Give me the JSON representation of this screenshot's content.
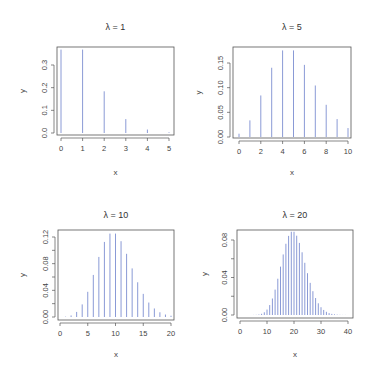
{
  "figure": {
    "width": 372,
    "height": 378,
    "bar_color": "#8a9ad6",
    "axis_color": "#555555",
    "text_color": "#444444"
  },
  "chart_data": [
    {
      "type": "bar",
      "subtype": "pmf-spikes",
      "title": "λ = 1",
      "xlabel": "x",
      "ylabel": "y",
      "x": [
        0,
        1,
        2,
        3,
        4,
        5
      ],
      "values": [
        0.3679,
        0.3679,
        0.1839,
        0.0613,
        0.0153,
        0.0031
      ],
      "xticks": [
        0,
        1,
        2,
        3,
        4,
        5
      ],
      "xtick_labels": [
        "0",
        "1",
        "2",
        "3",
        "4",
        "5"
      ],
      "yticks": [
        0,
        0.1,
        0.2,
        0.3
      ],
      "ytick_labels": [
        "0.0",
        "0.1",
        "0.2",
        "0.3"
      ],
      "xlim": [
        -0.2,
        5.2
      ],
      "ylim": [
        -0.005,
        0.37
      ],
      "grid": false,
      "layout": {
        "box": [
          57,
          47,
          174,
          135
        ],
        "x0": 61,
        "x1": 169,
        "xv0": 0,
        "xv1": 5,
        "y0px": 133,
        "y1px": 65,
        "yv0": 0,
        "yv1": 0.3,
        "title_y": 27,
        "xlabel_y": 172,
        "ylabel_x": 22
      }
    },
    {
      "type": "bar",
      "subtype": "pmf-spikes",
      "title": "λ = 5",
      "xlabel": "x",
      "ylabel": "y",
      "x": [
        0,
        1,
        2,
        3,
        4,
        5,
        6,
        7,
        8,
        9,
        10
      ],
      "values": [
        0.0067,
        0.0337,
        0.0842,
        0.1404,
        0.1755,
        0.1755,
        0.1462,
        0.1044,
        0.0653,
        0.0363,
        0.0181
      ],
      "xticks": [
        0,
        2,
        4,
        6,
        8,
        10
      ],
      "xtick_labels": [
        "0",
        "2",
        "4",
        "6",
        "8",
        "10"
      ],
      "yticks": [
        0,
        0.05,
        0.1,
        0.15
      ],
      "ytick_labels": [
        "0.00",
        "0.05",
        "0.10",
        "0.15"
      ],
      "xlim": [
        -0.4,
        10.4
      ],
      "ylim": [
        -0.005,
        0.18
      ],
      "grid": false,
      "layout": {
        "box": [
          233,
          47,
          351,
          138
        ],
        "x0": 239,
        "x1": 348,
        "xv0": 0,
        "xv1": 10,
        "y0px": 137,
        "y1px": 63,
        "yv0": 0,
        "yv1": 0.15,
        "title_y": 27,
        "xlabel_y": 172,
        "ylabel_x": 198
      }
    },
    {
      "type": "bar",
      "subtype": "pmf-spikes",
      "title": "λ = 10",
      "xlabel": "x",
      "ylabel": "y",
      "x": [
        0,
        1,
        2,
        3,
        4,
        5,
        6,
        7,
        8,
        9,
        10,
        11,
        12,
        13,
        14,
        15,
        16,
        17,
        18,
        19,
        20
      ],
      "values": [
        0.0,
        0.0005,
        0.0023,
        0.0076,
        0.0189,
        0.0378,
        0.0631,
        0.0901,
        0.1126,
        0.1251,
        0.1251,
        0.1137,
        0.0948,
        0.0729,
        0.0521,
        0.0347,
        0.0217,
        0.0128,
        0.0071,
        0.0037,
        0.0019
      ],
      "xticks": [
        0,
        5,
        10,
        15,
        20
      ],
      "xtick_labels": [
        "0",
        "5",
        "10",
        "15",
        "20"
      ],
      "yticks": [
        0,
        0.02,
        0.04,
        0.06,
        0.08,
        0.1,
        0.12
      ],
      "ytick_labels": [
        "0.00",
        "",
        "0.04",
        "",
        "0.08",
        "",
        "0.12"
      ],
      "xlim": [
        -0.8,
        20.8
      ],
      "ylim": [
        -0.003,
        0.128
      ],
      "grid": false,
      "layout": {
        "box": [
          58,
          230,
          174,
          320
        ],
        "x0": 60,
        "x1": 171,
        "xv0": 0,
        "xv1": 20,
        "y0px": 317,
        "y1px": 237,
        "yv0": 0,
        "yv1": 0.12,
        "title_y": 215,
        "xlabel_y": 354,
        "ylabel_x": 22
      }
    },
    {
      "type": "bar",
      "subtype": "pmf-spikes",
      "title": "λ = 20",
      "xlabel": "x",
      "ylabel": "y",
      "x": [
        0,
        1,
        2,
        3,
        4,
        5,
        6,
        7,
        8,
        9,
        10,
        11,
        12,
        13,
        14,
        15,
        16,
        17,
        18,
        19,
        20,
        21,
        22,
        23,
        24,
        25,
        26,
        27,
        28,
        29,
        30,
        31,
        32,
        33,
        34,
        35,
        36,
        37,
        38,
        39,
        40
      ],
      "values": [
        0.0,
        0.0,
        0.0,
        0.0,
        0.0,
        0.0001,
        0.0002,
        0.0005,
        0.0013,
        0.0029,
        0.0058,
        0.0106,
        0.0176,
        0.0271,
        0.0387,
        0.0516,
        0.0646,
        0.076,
        0.0844,
        0.0888,
        0.0888,
        0.0846,
        0.0769,
        0.0669,
        0.0557,
        0.0446,
        0.0343,
        0.0254,
        0.0181,
        0.0125,
        0.0083,
        0.0054,
        0.0034,
        0.002,
        0.0012,
        0.0007,
        0.0004,
        0.0002,
        0.0001,
        0.0001,
        0.0
      ],
      "xticks": [
        0,
        10,
        20,
        30,
        40
      ],
      "xtick_labels": [
        "0",
        "10",
        "20",
        "30",
        "40"
      ],
      "yticks": [
        0,
        0.02,
        0.04,
        0.06,
        0.08
      ],
      "ytick_labels": [
        "0.00",
        "",
        "0.04",
        "",
        "0.08"
      ],
      "xlim": [
        -1.6,
        41.6
      ],
      "ylim": [
        -0.002,
        0.091
      ],
      "grid": false,
      "layout": {
        "box": [
          237,
          230,
          353,
          318
        ],
        "x0": 240,
        "x1": 348,
        "xv0": 0,
        "xv1": 40,
        "y0px": 315,
        "y1px": 240,
        "yv0": 0,
        "yv1": 0.08,
        "title_y": 215,
        "xlabel_y": 354,
        "ylabel_x": 204
      }
    }
  ]
}
